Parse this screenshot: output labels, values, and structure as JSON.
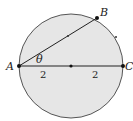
{
  "diagram": {
    "circle": {
      "cx": 71,
      "cy": 66,
      "r": 52,
      "fill": "#e6e6e6",
      "stroke": "#555555"
    },
    "points": {
      "A": {
        "label": "A",
        "x": 19,
        "y": 66
      },
      "B": {
        "label": "B",
        "x": 97,
        "y": 18
      },
      "C": {
        "label": "C",
        "x": 123,
        "y": 66
      },
      "center": {
        "x": 71,
        "y": 66
      }
    },
    "angle_label": "θ",
    "segment_labels": {
      "left": "2",
      "right": "2"
    },
    "tick_marks": [
      {
        "x": 68,
        "y": 36
      },
      {
        "x": 116,
        "y": 37
      }
    ]
  }
}
